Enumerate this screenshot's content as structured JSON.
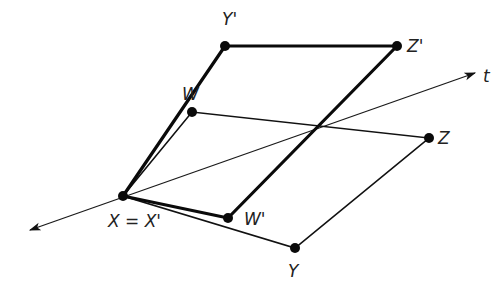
{
  "diagram": {
    "title": "",
    "axis": {
      "label": "t",
      "from": [
        30,
        230
      ],
      "to": [
        475,
        73
      ]
    },
    "points": {
      "X": {
        "label": "X = X'",
        "pos": [
          123,
          196
        ],
        "label_pos": [
          108,
          227
        ]
      },
      "Y": {
        "label": "Y",
        "pos": [
          295,
          248
        ],
        "label_pos": [
          288,
          277
        ]
      },
      "Z": {
        "label": "Z",
        "pos": [
          429,
          138
        ],
        "label_pos": [
          438,
          144
        ]
      },
      "W": {
        "label": "W",
        "pos": [
          192,
          112
        ],
        "label_pos": [
          182,
          100
        ]
      },
      "Yp": {
        "label": "Y'",
        "pos": [
          225,
          46
        ],
        "label_pos": [
          222,
          25
        ]
      },
      "Zp": {
        "label": "Z'",
        "pos": [
          397,
          46
        ],
        "label_pos": [
          407,
          52
        ]
      },
      "Wp": {
        "label": "W'",
        "pos": [
          228,
          218
        ],
        "label_pos": [
          244,
          225
        ]
      }
    },
    "original_quad": [
      "X",
      "W",
      "Z",
      "Y"
    ],
    "transformed_quad": [
      "X",
      "Yp",
      "Zp",
      "Wp"
    ],
    "axis_label_pos": [
      483,
      82
    ],
    "colors": {
      "line": "#111111",
      "point": "#0a0a0a",
      "background": "#ffffff"
    }
  }
}
